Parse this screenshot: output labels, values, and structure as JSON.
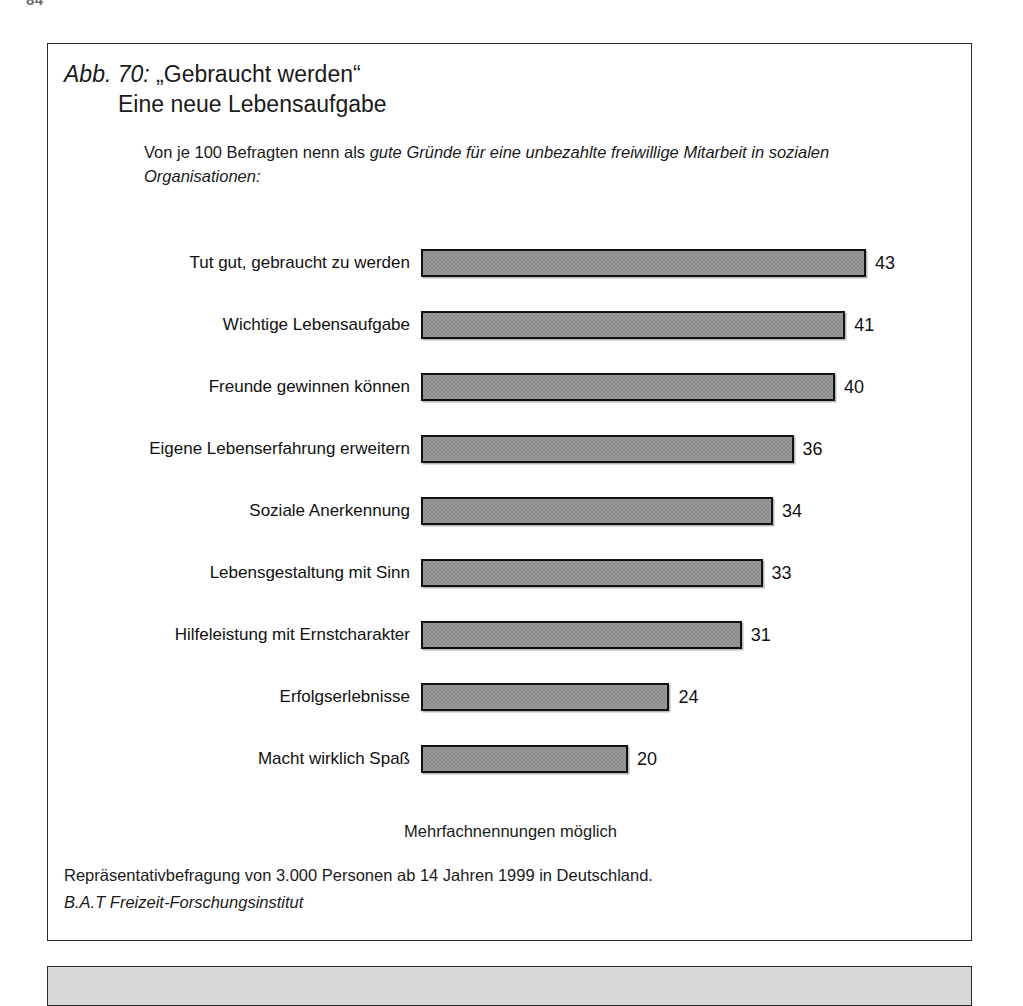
{
  "page": {
    "page_number_sliver": "84"
  },
  "figure": {
    "title_prefix": "Abb. 70:",
    "title_main": "„Gebraucht werden“",
    "title_line_2": "Eine neue Lebensaufgabe",
    "subtitle_plain": "Von je 100 Befragten nenn als ",
    "subtitle_italic": "gute Gründe für eine unbezahlte freiwillige Mitarbeit in sozialen Organisationen:",
    "note": "Mehrfachnennungen möglich",
    "source_line": "Repräsentativbefragung von 3.000 Personen ab 14 Jahren 1999 in Deutschland.",
    "source_institute": "B.A.T Freizeit-Forschungsinstitut"
  },
  "chart_data": {
    "type": "bar",
    "orientation": "horizontal",
    "subtitle": "Von je 100 Befragten nenn als gute Gründe für eine unbezahlte freiwillige Mitarbeit in sozialen Organisationen:",
    "xlabel": "",
    "ylabel": "",
    "xlim": [
      0,
      43
    ],
    "grid": false,
    "legend": "none",
    "value_labels": true,
    "categories": [
      "Tut gut, gebraucht zu werden",
      "Wichtige Lebensaufgabe",
      "Freunde gewinnen können",
      "Eigene Lebenserfahrung erweitern",
      "Soziale Anerkennung",
      "Lebensgestaltung mit Sinn",
      "Hilfeleistung mit Ernstcharakter",
      "Erfolgserlebnisse",
      "Macht wirklich Spaß"
    ],
    "values": [
      43,
      41,
      40,
      36,
      34,
      33,
      31,
      24,
      20
    ],
    "annotations": [
      "Mehrfachnennungen möglich",
      "Repräsentativbefragung von 3.000 Personen ab 14 Jahren 1999 in Deutschland.",
      "B.A.T Freizeit-Forschungsinstitut"
    ],
    "colors": {
      "bar_fill": "#8d8d8d",
      "bar_border": "#111111",
      "background": "#ffffff",
      "text": "#111111",
      "box_border": "#2b2b2b"
    }
  },
  "bars": [
    {
      "label": "Tut gut, gebraucht zu werden",
      "value": 43,
      "value_text": "43"
    },
    {
      "label": "Wichtige Lebensaufgabe",
      "value": 41,
      "value_text": "41"
    },
    {
      "label": "Freunde gewinnen können",
      "value": 40,
      "value_text": "40"
    },
    {
      "label": "Eigene Lebenserfahrung erweitern",
      "value": 36,
      "value_text": "36"
    },
    {
      "label": "Soziale Anerkennung",
      "value": 34,
      "value_text": "34"
    },
    {
      "label": "Lebensgestaltung mit Sinn",
      "value": 33,
      "value_text": "33"
    },
    {
      "label": "Hilfeleistung mit Ernstcharakter",
      "value": 31,
      "value_text": "31"
    },
    {
      "label": "Erfolgserlebnisse",
      "value": 24,
      "value_text": "24"
    },
    {
      "label": "Macht wirklich Spaß",
      "value": 20,
      "value_text": "20"
    }
  ]
}
